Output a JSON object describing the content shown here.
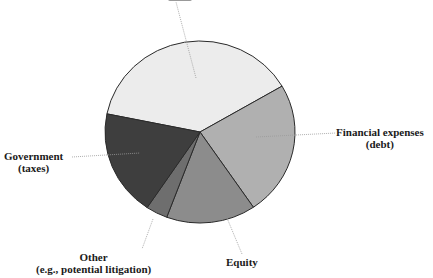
{
  "chart_data": {
    "type": "pie",
    "title": "",
    "center": [
      200,
      132
    ],
    "radius": [
      95,
      91
    ],
    "start_angle_deg": 191.5,
    "slices": [
      {
        "name": "top-slice",
        "label": "",
        "label_note": "label cut off at top edge",
        "percent": 38.4,
        "color": "#ececec",
        "leader": [
          [
            196,
            78
          ],
          [
            176,
            2
          ]
        ]
      },
      {
        "name": "financial-expenses",
        "label": "Financial expenses\n(debt)",
        "percent": 23.9,
        "color": "#b0b0b0",
        "leader": [
          [
            256,
            137
          ],
          [
            336,
            133
          ]
        ]
      },
      {
        "name": "equity",
        "label": "Equity",
        "percent": 15.2,
        "color": "#8c8c8c",
        "leader": [
          [
            227,
            218
          ],
          [
            242,
            254
          ]
        ]
      },
      {
        "name": "other",
        "label": "Other\n(e.g., potential litigation)",
        "percent": 3.7,
        "color": "#6e6e6e",
        "leader": [
          [
            153,
            219
          ],
          [
            142,
            249
          ]
        ]
      },
      {
        "name": "government",
        "label": "Government\n(taxes)",
        "percent": 18.8,
        "color": "#3e3e3e",
        "leader": [
          [
            72,
            157
          ],
          [
            140,
            153
          ]
        ]
      }
    ]
  },
  "labels": {
    "financial_line1": "Financial expenses",
    "financial_line2": "(debt)",
    "government_line1": "Government",
    "government_line2": "(taxes)",
    "other_line1": "Other",
    "other_line2": "(e.g., potential litigation)",
    "equity": "Equity"
  }
}
